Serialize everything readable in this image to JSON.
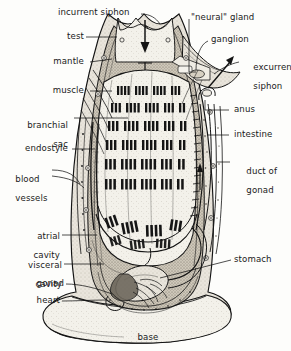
{
  "figure": {
    "organism": "solitary ascidian tunicate",
    "view": "longitudinal section",
    "style": "black-and-white stippled line engraving",
    "background_color": "#fdfdfb",
    "ink_color": "#141414"
  },
  "labels": [
    {
      "id": "incurrent-siphon",
      "text": "incurrent siphon",
      "side": "top",
      "align": "left"
    },
    {
      "id": "test",
      "text": "test",
      "side": "left",
      "align": "right"
    },
    {
      "id": "mantle",
      "text": "mantle",
      "side": "left",
      "align": "right"
    },
    {
      "id": "muscle",
      "text": "muscle",
      "side": "left",
      "align": "right"
    },
    {
      "id": "branchial-sac",
      "text": "branchial\nsac",
      "side": "left",
      "align": "right"
    },
    {
      "id": "endostyle",
      "text": "endostyle",
      "side": "left",
      "align": "right"
    },
    {
      "id": "blood-vessels",
      "text": "blood\nvessels",
      "side": "left",
      "align": "left"
    },
    {
      "id": "atrial-cavity",
      "text": "atrial\ncavity",
      "side": "left",
      "align": "right"
    },
    {
      "id": "visceral-cavity",
      "text": "visceral\ncavity",
      "side": "left",
      "align": "right"
    },
    {
      "id": "gonad",
      "text": "gonad",
      "side": "left",
      "align": "right"
    },
    {
      "id": "heart",
      "text": "heart",
      "side": "left",
      "align": "right"
    },
    {
      "id": "neural-gland",
      "text": "\"neural\" gland",
      "side": "right",
      "align": "left"
    },
    {
      "id": "ganglion",
      "text": "ganglion",
      "side": "right",
      "align": "left"
    },
    {
      "id": "excurrent-siphon",
      "text": "excurrent\nsiphon",
      "side": "right",
      "align": "left"
    },
    {
      "id": "anus",
      "text": "anus",
      "side": "right",
      "align": "left"
    },
    {
      "id": "intestine",
      "text": "intestine",
      "side": "right",
      "align": "left"
    },
    {
      "id": "duct-of-gonad",
      "text": "duct of\ngonad",
      "side": "right",
      "align": "left"
    },
    {
      "id": "stomach",
      "text": "stomach",
      "side": "right",
      "align": "left"
    },
    {
      "id": "base",
      "text": "base",
      "side": "bottom",
      "align": "center"
    }
  ],
  "label_text": {
    "incurrent_siphon": "incurrent siphon",
    "test": "test",
    "mantle": "mantle",
    "muscle": "muscle",
    "branchial_sac_l1": "branchial",
    "branchial_sac_l2": "sac",
    "endostyle": "endostyle",
    "blood_vessels_l1": "blood",
    "blood_vessels_l2": "vessels",
    "atrial_cavity_l1": "atrial",
    "atrial_cavity_l2": "cavity",
    "visceral_cavity_l1": "visceral",
    "visceral_cavity_l2": "cavity",
    "gonad": "gonad",
    "heart": "heart",
    "neural_gland": "\"neural\" gland",
    "ganglion": "ganglion",
    "excurrent_siphon_l1": "excurrent",
    "excurrent_siphon_l2": "siphon",
    "anus": "anus",
    "intestine": "intestine",
    "duct_of_gonad_l1": "duct of",
    "duct_of_gonad_l2": "gonad",
    "stomach": "stomach",
    "base": "base"
  },
  "annotations": {
    "flow_arrows": [
      {
        "id": "incurrent-flow-arrow",
        "direction": "down",
        "meaning": "water entering incurrent siphon"
      },
      {
        "id": "pharynx-flow-arrow",
        "direction": "down",
        "meaning": "water passing into branchial sac"
      },
      {
        "id": "excurrent-flow-arrow",
        "direction": "up-right",
        "meaning": "water leaving excurrent siphon"
      },
      {
        "id": "atrial-flow-arrow",
        "direction": "up",
        "meaning": "water rising through atrial cavity"
      }
    ]
  }
}
